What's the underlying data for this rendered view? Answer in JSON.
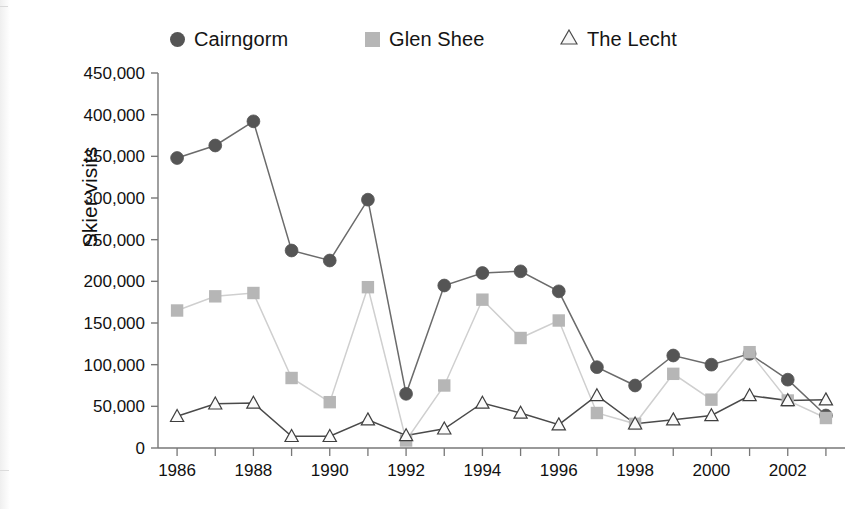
{
  "figure": {
    "background_color": "#ffffff"
  },
  "legend": {
    "position": "top",
    "entries": [
      {
        "label": "Cairngorm",
        "marker": "circle-marker-icon",
        "color": "#555555"
      },
      {
        "label": "Glen Shee",
        "marker": "square-marker-icon",
        "color": "#b6b6b6"
      },
      {
        "label": "The Lecht",
        "marker": "triangle-marker-icon",
        "color": "#f2f2f2"
      }
    ]
  },
  "axes": {
    "ylabel": "Skier visits",
    "xlabel": "",
    "yticks": [
      "0",
      "50,000",
      "100,000",
      "150,000",
      "200,000",
      "250,000",
      "300,000",
      "350,000",
      "400,000",
      "450,000"
    ],
    "xticks": [
      "1986",
      "1988",
      "1990",
      "1992",
      "1994",
      "1996",
      "1998",
      "2000",
      "2002"
    ]
  },
  "chart_data": {
    "type": "line",
    "title": "",
    "subtitle": "",
    "xlabel": "",
    "ylabel": "Skier visits",
    "x": [
      1986,
      1987,
      1988,
      1989,
      1990,
      1991,
      1992,
      1993,
      1994,
      1995,
      1996,
      1997,
      1998,
      1999,
      2000,
      2001,
      2002,
      2003
    ],
    "xlim": [
      1985.5,
      2003.5
    ],
    "ylim": [
      0,
      450000
    ],
    "ytick_step": 50000,
    "grid": false,
    "legend_position": "top",
    "series": [
      {
        "name": "Cairngorm",
        "marker": "circle",
        "color": "#555555",
        "line_color": "#6b6b6b",
        "values": [
          348000,
          363000,
          392000,
          237000,
          225000,
          298000,
          65000,
          195000,
          210000,
          212000,
          188000,
          97000,
          75000,
          111000,
          100000,
          113000,
          82000,
          39000
        ]
      },
      {
        "name": "Glen Shee",
        "marker": "square",
        "color": "#b6b6b6",
        "line_color": "#cfcfcf",
        "values": [
          165000,
          182000,
          186000,
          84000,
          55000,
          193000,
          9000,
          75000,
          178000,
          132000,
          153000,
          42000,
          29000,
          89000,
          58000,
          115000,
          57000,
          36000
        ]
      },
      {
        "name": "The Lecht",
        "marker": "triangle",
        "color": "#f2f2f2",
        "line_color": "#4a4a4a",
        "values": [
          38000,
          53000,
          54000,
          14000,
          14000,
          34000,
          15000,
          23000,
          54000,
          42000,
          28000,
          63000,
          29000,
          34000,
          39000,
          63000,
          57000,
          58000
        ]
      }
    ]
  }
}
